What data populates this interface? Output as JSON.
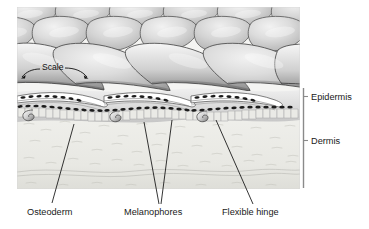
{
  "figure": {
    "type": "anatomical-diagram",
    "style": "grayscale-halftone-illustration",
    "palette": {
      "background": "#ffffff",
      "scale_light": "#e9e9e9",
      "scale_mid": "#c4c4c4",
      "scale_dark": "#8f8f8f",
      "outline": "#3a3a3a",
      "melanophore": "#1c1c1c",
      "epidermis_fill": "#dcdcdc",
      "dermis_fill": "#ededea",
      "leader_line": "#111111",
      "text": "#1a1a1a",
      "bracket": "#6b6b6b"
    }
  },
  "labels": {
    "scale": "Scale",
    "epidermis": "Epidermis",
    "dermis": "Dermis",
    "osteoderm": "Osteoderm",
    "melanophores": "Melanophores",
    "flexible_hinge": "Flexible hinge"
  },
  "regions": [
    {
      "name": "scales",
      "description": "Overlapping rounded keratinous scales forming the outer surface"
    },
    {
      "name": "epidermis",
      "description": "Upper skin layer containing melanophore pigment cells"
    },
    {
      "name": "dermis",
      "description": "Lower fibrous connective tissue layer"
    }
  ],
  "callouts": [
    {
      "name": "osteoderm",
      "label": "Osteoderm",
      "label_x": 28,
      "label_y": 213,
      "leader_to_x": 74,
      "leader_to_y": 130
    },
    {
      "name": "melanophores",
      "label": "Melanophores",
      "label_x": 124,
      "label_y": 213,
      "leader_to_x": 146,
      "leader_to_y": 126
    },
    {
      "name": "flexible-hinge",
      "label": "Flexible hinge",
      "label_x": 222,
      "label_y": 213,
      "leader_to_x": 215,
      "leader_to_y": 124
    }
  ],
  "brackets": [
    {
      "name": "epidermis",
      "label": "Epidermis",
      "top": 88,
      "bottom": 116,
      "tick_y": 99
    },
    {
      "name": "dermis",
      "label": "Dermis",
      "top": 116,
      "bottom": 188,
      "tick_y": 143
    }
  ]
}
